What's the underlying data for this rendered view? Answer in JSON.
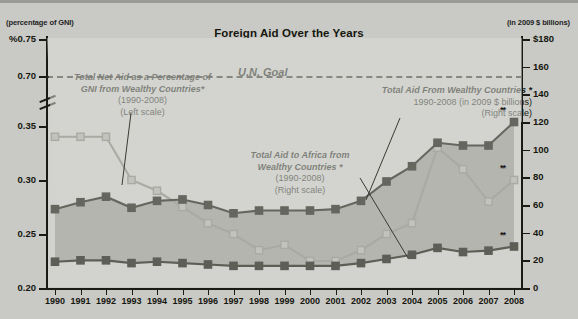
{
  "header": {
    "title": "Foreign Aid Over the Years",
    "left_scale_note": "(percentage of GNI)",
    "right_scale_note": "(in 2009 $ billions)"
  },
  "annotations": {
    "un_goal": "U.N. Goal",
    "gni_series": {
      "line1": "Total Net Aid as a Percentage of",
      "line2": "GNI from Wealthy Countries*",
      "line3": "(1990-2008)",
      "line4": "(Left scale)"
    },
    "total_aid_series": {
      "line1": "Total Aid From Wealthy Countries *",
      "line2": "1990-2008 (in 2009 $ billions)",
      "line3": "(Right scale)"
    },
    "africa_series": {
      "line1": "Total Aid to Africa from",
      "line2": "Wealthy Countries *",
      "line3": "(1990-2008)",
      "line4": "(Right scale)"
    },
    "estimate_marker": "**"
  },
  "colors": {
    "background": "#c9cac5",
    "plot_background": "#d2d3ce",
    "area_fill": "#b6b7b1",
    "dark_series": "#6e7068",
    "light_series": "#b9bab3",
    "axis": "#1b1b15",
    "text": "#16160f"
  },
  "chart_data": {
    "type": "line",
    "title": "Foreign Aid Over the Years",
    "xlabel": "",
    "ylabel": "percentage of GNI",
    "y2label": "in 2009 $ billions",
    "grid": false,
    "legend": "annotations",
    "categories": [
      "1990",
      "1991",
      "1992",
      "1993",
      "1994",
      "1995",
      "1996",
      "1997",
      "1998",
      "1999",
      "2000",
      "2001",
      "2002",
      "2003",
      "2004",
      "2005",
      "2006",
      "2007",
      "2008"
    ],
    "left_axis": {
      "label": "(percentage of GNI)",
      "ticks": [
        "%0.75",
        "0.70",
        "0.35",
        "0.30",
        "0.25",
        "0.20"
      ],
      "tick_values": [
        0.75,
        0.7,
        0.35,
        0.3,
        0.25,
        0.2
      ],
      "broken_axis": true,
      "break_between": [
        0.7,
        0.35
      ],
      "ylim_lower_segment": [
        0.2,
        0.35
      ],
      "ylim_upper_segment": [
        0.7,
        0.75
      ]
    },
    "right_axis": {
      "label": "(in 2009 $ billions)",
      "ticks": [
        "0",
        "20",
        "40",
        "60",
        "80",
        "100",
        "120",
        "140",
        "160",
        "$180"
      ],
      "tick_values": [
        0,
        20,
        40,
        60,
        80,
        100,
        120,
        140,
        160,
        180
      ],
      "ylim": [
        0,
        180
      ]
    },
    "reference_line": {
      "label": "U.N. Goal",
      "value": 0.7,
      "axis": "left",
      "style": "dashed"
    },
    "series": [
      {
        "name": "Total Net Aid as a Percentage of GNI from Wealthy Countries (1990-2008)",
        "axis": "left",
        "unit": "percentage of GNI",
        "style": "light",
        "values": [
          0.34,
          0.34,
          0.34,
          0.3,
          0.29,
          0.275,
          0.26,
          0.25,
          0.235,
          0.24,
          0.225,
          0.225,
          0.235,
          0.25,
          0.26,
          0.33,
          0.31,
          0.28,
          0.3
        ],
        "estimate_last": true
      },
      {
        "name": "Total Aid From Wealthy Countries (1990-2008, in 2009 $ billions)",
        "axis": "right",
        "unit": "2009 $ billions",
        "style": "dark",
        "values": [
          57,
          62,
          66,
          58,
          63,
          64,
          60,
          54,
          56,
          56,
          56,
          57,
          63,
          77,
          88,
          105,
          103,
          103,
          120
        ],
        "estimate_last": true
      },
      {
        "name": "Total Aid to Africa from Wealthy Countries (1990-2008)",
        "axis": "right",
        "unit": "2009 $ billions",
        "style": "dark",
        "values": [
          19,
          20,
          20,
          18,
          19,
          18,
          17,
          16,
          16,
          16,
          16,
          16,
          18,
          21,
          24,
          29,
          26,
          27,
          30
        ],
        "estimate_last": true
      }
    ],
    "footnote_marker": "*",
    "estimate_marker": "**"
  }
}
